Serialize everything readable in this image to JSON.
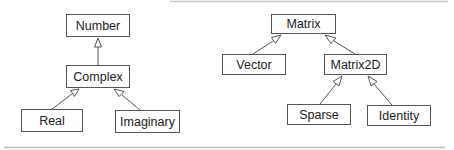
{
  "diagram": {
    "type": "uml-class-hierarchy",
    "colors": {
      "line": "#555555",
      "text": "#222222",
      "rule": "#bbbbbb",
      "background": "#ffffff"
    },
    "nodes": [
      {
        "id": "number",
        "label": "Number",
        "x": 66,
        "y": 14,
        "w": 64,
        "h": 23
      },
      {
        "id": "complex",
        "label": "Complex",
        "x": 66,
        "y": 65,
        "w": 64,
        "h": 23
      },
      {
        "id": "real",
        "label": "Real",
        "x": 21,
        "y": 109,
        "w": 62,
        "h": 23
      },
      {
        "id": "imaginary",
        "label": "Imaginary",
        "x": 115,
        "y": 110,
        "w": 65,
        "h": 23
      },
      {
        "id": "matrix",
        "label": "Matrix",
        "x": 271,
        "y": 14,
        "w": 65,
        "h": 20
      },
      {
        "id": "vector",
        "label": "Vector",
        "x": 222,
        "y": 54,
        "w": 64,
        "h": 21
      },
      {
        "id": "matrix2d",
        "label": "Matrix2D",
        "x": 324,
        "y": 54,
        "w": 63,
        "h": 21
      },
      {
        "id": "sparse",
        "label": "Sparse",
        "x": 287,
        "y": 104,
        "w": 64,
        "h": 21
      },
      {
        "id": "identity",
        "label": "Identity",
        "x": 367,
        "y": 105,
        "w": 64,
        "h": 21
      }
    ],
    "edges": [
      {
        "from": "complex",
        "to": "number",
        "kind": "generalization"
      },
      {
        "from": "real",
        "to": "complex",
        "kind": "generalization"
      },
      {
        "from": "imaginary",
        "to": "complex",
        "kind": "generalization"
      },
      {
        "from": "vector",
        "to": "matrix",
        "kind": "generalization"
      },
      {
        "from": "matrix2d",
        "to": "matrix",
        "kind": "generalization"
      },
      {
        "from": "sparse",
        "to": "matrix2d",
        "kind": "generalization"
      },
      {
        "from": "identity",
        "to": "matrix2d",
        "kind": "generalization"
      }
    ]
  }
}
